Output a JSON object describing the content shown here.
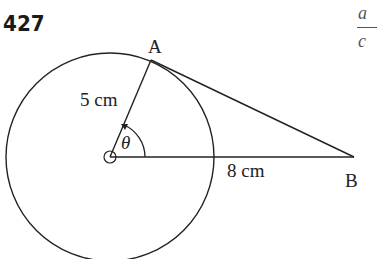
{
  "problem_number": "427",
  "labels": {
    "point_a": "A",
    "point_b": "B",
    "radius": "5 cm",
    "distance_ob": "8 cm",
    "angle": "θ"
  },
  "fraction_fragment": {
    "numerator": "a",
    "denominator": "c"
  },
  "geometry": {
    "center": [
      110,
      157
    ],
    "radius_px": 104,
    "point_a": [
      151,
      60
    ],
    "point_b": [
      354,
      157
    ],
    "stroke_color": "#222222"
  }
}
